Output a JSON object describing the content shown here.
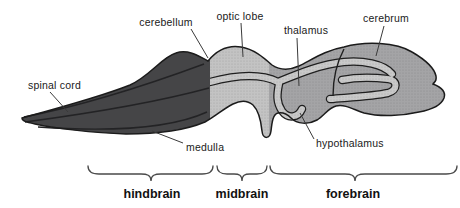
{
  "diagram": {
    "part_labels": {
      "spinal_cord": "spinal cord",
      "cerebellum": "cerebellum",
      "optic_lobe": "optic lobe",
      "thalamus": "thalamus",
      "cerebrum": "cerebrum",
      "medulla": "medulla",
      "hypothalamus": "hypothalamus"
    },
    "region_labels": {
      "hindbrain": "hindbrain",
      "midbrain": "midbrain",
      "forebrain": "forebrain"
    },
    "colors": {
      "hindbrain_fill": "#454547",
      "midbrain_fill": "#c3c3c3",
      "forebrain_fill": "#a4a4a6",
      "ventricle_band": "#c9c9c9",
      "outline": "#1b1b1b",
      "background": "#ffffff"
    }
  }
}
